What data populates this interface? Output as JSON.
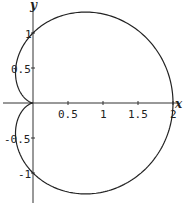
{
  "chart_data": {
    "type": "line",
    "title": "",
    "xlabel": "x",
    "ylabel": "y",
    "curve": "cardioid r = 1 + cos(theta)",
    "xlim": [
      -0.47,
      2.2
    ],
    "ylim": [
      -1.5,
      1.48
    ],
    "x_ticks": [
      "0.5",
      "1",
      "1.5",
      "2"
    ],
    "y_ticks": [
      "1",
      "0.5",
      "-0.5",
      "-1"
    ],
    "grid": false,
    "legend": null,
    "color": "#222222",
    "key_points": [
      {
        "x": 0,
        "y": 0
      },
      {
        "x": 2,
        "y": 0
      },
      {
        "x": 0,
        "y": 1
      },
      {
        "x": 0,
        "y": -1
      },
      {
        "x": 0.5,
        "y": 1.3
      },
      {
        "x": 0.5,
        "y": -1.3
      },
      {
        "x": -0.25,
        "y": 0.43
      },
      {
        "x": -0.25,
        "y": -0.43
      }
    ]
  },
  "axes": {
    "x_label": "x",
    "y_label": "y",
    "x_tick_labels": [
      "0.5",
      "1",
      "1.5",
      "2"
    ],
    "y_tick_labels": [
      "1",
      "0.5",
      "-0.5",
      "-1"
    ]
  }
}
